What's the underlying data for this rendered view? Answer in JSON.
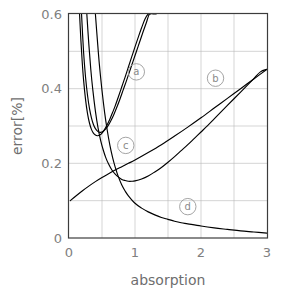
{
  "chart_data": {
    "type": "line",
    "title": "",
    "xlabel": "absorption",
    "ylabel": "error[%]",
    "xlim": [
      0,
      3
    ],
    "ylim": [
      0,
      0.6
    ],
    "grid": true,
    "x_ticks": [
      "0",
      "1",
      "2",
      "3"
    ],
    "x_tick_values": [
      0,
      1,
      2,
      3
    ],
    "y_ticks": [
      "0",
      "0.2",
      "0.4",
      "0.6"
    ],
    "y_tick_values": [
      0,
      0.2,
      0.4,
      0.6
    ],
    "x_gridline_values": [
      0.5,
      1,
      1.5,
      2,
      2.5
    ],
    "y_gridline_values": [
      0.1,
      0.2,
      0.3,
      0.4,
      0.5
    ],
    "legend_position": "inline-annotations",
    "series": [
      {
        "name": "a",
        "label": "a",
        "label_x": 1.02,
        "label_y": 0.445,
        "comment": "upper U-shaped curve of the (a) pair; steep rise off top of axes",
        "x": [
          0.16,
          0.18,
          0.2,
          0.22,
          0.25,
          0.28,
          0.31,
          0.34,
          0.37,
          0.4,
          0.43,
          0.46,
          0.5,
          0.54,
          0.58,
          0.62,
          0.66,
          0.7,
          0.75,
          0.8,
          0.85,
          0.9,
          0.95,
          1.0,
          1.05,
          1.1,
          1.15,
          1.2,
          1.24
        ],
        "y": [
          0.6,
          0.53,
          0.472,
          0.425,
          0.372,
          0.334,
          0.308,
          0.291,
          0.281,
          0.276,
          0.274,
          0.275,
          0.281,
          0.291,
          0.304,
          0.319,
          0.336,
          0.354,
          0.379,
          0.405,
          0.431,
          0.458,
          0.485,
          0.512,
          0.538,
          0.563,
          0.586,
          0.6,
          0.6
        ]
      },
      {
        "name": "a2",
        "label": "",
        "comment": "second, nearly-parallel curve of the (a) pair, slightly to the right / lower minimum",
        "x": [
          0.19,
          0.22,
          0.25,
          0.28,
          0.31,
          0.34,
          0.37,
          0.4,
          0.44,
          0.48,
          0.52,
          0.56,
          0.6,
          0.64,
          0.68,
          0.72,
          0.77,
          0.82,
          0.87,
          0.92,
          0.97,
          1.02,
          1.07,
          1.12,
          1.17,
          1.22,
          1.28,
          1.32
        ],
        "y": [
          0.6,
          0.5,
          0.432,
          0.383,
          0.347,
          0.322,
          0.304,
          0.293,
          0.285,
          0.283,
          0.286,
          0.293,
          0.303,
          0.316,
          0.331,
          0.348,
          0.371,
          0.396,
          0.421,
          0.447,
          0.473,
          0.499,
          0.525,
          0.551,
          0.576,
          0.6,
          0.6,
          0.6
        ]
      },
      {
        "name": "b",
        "label": "b",
        "label_x": 2.22,
        "label_y": 0.428,
        "comment": "monotonically increasing, roughly linear curve from (0,0.10) to (3,0.45)",
        "x": [
          0.02,
          0.1,
          0.2,
          0.3,
          0.4,
          0.5,
          0.6,
          0.7,
          0.8,
          0.9,
          1.0,
          1.2,
          1.4,
          1.6,
          1.8,
          2.0,
          2.2,
          2.4,
          2.6,
          2.8,
          3.0
        ],
        "y": [
          0.1,
          0.112,
          0.126,
          0.139,
          0.151,
          0.162,
          0.172,
          0.182,
          0.191,
          0.2,
          0.209,
          0.229,
          0.25,
          0.273,
          0.297,
          0.322,
          0.348,
          0.374,
          0.4,
          0.426,
          0.452
        ]
      },
      {
        "name": "c",
        "label": "c",
        "label_x": 0.86,
        "label_y": 0.248,
        "comment": "U-shaped curve with shallow minimum ~0.152 around absorption 0.9, rising to right edge",
        "x": [
          0.27,
          0.3,
          0.33,
          0.36,
          0.4,
          0.44,
          0.48,
          0.52,
          0.56,
          0.6,
          0.65,
          0.7,
          0.75,
          0.8,
          0.85,
          0.9,
          0.95,
          1.0,
          1.1,
          1.2,
          1.3,
          1.4,
          1.5,
          1.6,
          1.7,
          1.8,
          1.9,
          2.0,
          2.1,
          2.2,
          2.3,
          2.4,
          2.5,
          2.6,
          2.7,
          2.8,
          2.9,
          3.0
        ],
        "y": [
          0.6,
          0.52,
          0.452,
          0.398,
          0.34,
          0.295,
          0.261,
          0.235,
          0.214,
          0.198,
          0.182,
          0.171,
          0.163,
          0.157,
          0.154,
          0.152,
          0.152,
          0.153,
          0.158,
          0.166,
          0.177,
          0.189,
          0.203,
          0.218,
          0.234,
          0.25,
          0.267,
          0.284,
          0.301,
          0.319,
          0.337,
          0.355,
          0.373,
          0.391,
          0.409,
          0.427,
          0.445,
          0.452
        ]
      },
      {
        "name": "d",
        "label": "d",
        "label_x": 1.8,
        "label_y": 0.084,
        "comment": "monotonically decaying curve from top-left, asymptotic to ~0.012 at absorption 3",
        "x": [
          0.4,
          0.43,
          0.46,
          0.5,
          0.54,
          0.58,
          0.62,
          0.66,
          0.7,
          0.75,
          0.8,
          0.85,
          0.9,
          1.0,
          1.1,
          1.2,
          1.3,
          1.4,
          1.5,
          1.6,
          1.7,
          1.8,
          2.0,
          2.2,
          2.4,
          2.6,
          2.8,
          3.0
        ],
        "y": [
          0.6,
          0.53,
          0.465,
          0.395,
          0.336,
          0.288,
          0.248,
          0.216,
          0.19,
          0.163,
          0.142,
          0.126,
          0.113,
          0.093,
          0.08,
          0.07,
          0.062,
          0.055,
          0.05,
          0.045,
          0.041,
          0.038,
          0.032,
          0.027,
          0.023,
          0.019,
          0.016,
          0.013
        ]
      }
    ]
  },
  "style": {
    "curve_color": "#000000",
    "grid_color": "#b9b9b9",
    "frame_color": "#3c3c3c",
    "tick_text_color": "#808080",
    "label_text_color": "#8a8a8a",
    "background": "#ffffff"
  }
}
